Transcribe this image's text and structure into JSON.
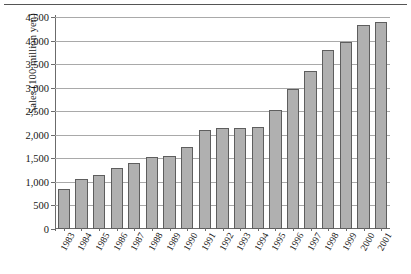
{
  "chart_data": {
    "type": "bar",
    "title": "",
    "xlabel": "",
    "ylabel": "Sales (100 million yen)",
    "categories": [
      "1983",
      "1984",
      "1985",
      "1986",
      "1987",
      "1988",
      "1989",
      "1990",
      "1991",
      "1992",
      "1993",
      "1994",
      "1995",
      "1996",
      "1997",
      "1998",
      "1999",
      "2000",
      "2001"
    ],
    "values": [
      840,
      1070,
      1140,
      1290,
      1410,
      1530,
      1560,
      1740,
      2110,
      2140,
      2140,
      2160,
      2520,
      2980,
      3350,
      3800,
      3980,
      4320,
      4400
    ],
    "ylim": [
      0,
      4500
    ],
    "ytick_values": [
      0,
      500,
      1000,
      1500,
      2000,
      2500,
      3000,
      3500,
      4000,
      4500
    ],
    "ytick_labels": [
      "0",
      "500",
      "1,000",
      "1,500",
      "2,000",
      "2,500",
      "3,000",
      "3,500",
      "4,000",
      "4,500"
    ],
    "grid": "horizontal",
    "legend": "none",
    "bar_fill_color": "#b0b0b0",
    "bar_border_color": "#5e5e5e",
    "gridline_color": "#a9a9a9",
    "axis_color": "#6b6b6b"
  }
}
